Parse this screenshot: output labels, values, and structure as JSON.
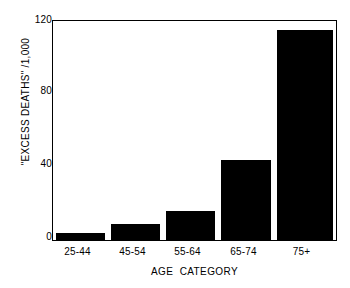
{
  "chart_data": {
    "type": "bar",
    "title": "",
    "subtitle": "",
    "xlabel": "AGE  CATEGORY",
    "ylabel": "\"EXCESS DEATHS\" /1,000",
    "categories": [
      "25-44",
      "45-54",
      "55-64",
      "65-74",
      "75+"
    ],
    "values": [
      4,
      9,
      16,
      44,
      115
    ],
    "ylim": [
      0,
      120
    ],
    "yticks": [
      0,
      40,
      80,
      120
    ],
    "ytick_labels": [
      "0",
      "40",
      "80",
      "120"
    ],
    "grid": false,
    "legend": null,
    "annotations": [],
    "bar_color": "#000000",
    "background_color": "#ffffff",
    "axis_color": "#000000"
  },
  "axes": {
    "y": {
      "title": "\"EXCESS DEATHS\" /1,000",
      "ticks": [
        {
          "value": 120,
          "label": "120"
        },
        {
          "value": 80,
          "label": "80"
        },
        {
          "value": 40,
          "label": "40"
        },
        {
          "value": 0,
          "label": "0"
        }
      ]
    },
    "x": {
      "title": "AGE  CATEGORY",
      "ticks": [
        {
          "label": "25-44"
        },
        {
          "label": "45-54"
        },
        {
          "label": "55-64"
        },
        {
          "label": "65-74"
        },
        {
          "label": "75+"
        }
      ]
    }
  }
}
